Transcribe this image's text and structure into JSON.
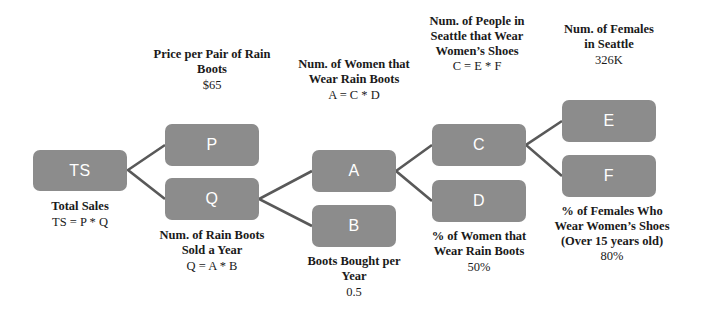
{
  "diagram": {
    "type": "estimation-tree",
    "palette": {
      "node_fill": "#8c8c8c",
      "node_text": "#ffffff",
      "caption_text": "#1a1a1a",
      "connector": "#595959",
      "background": "#ffffff"
    },
    "nodes": [
      {
        "id": "TS",
        "label": "TS"
      },
      {
        "id": "P",
        "label": "P"
      },
      {
        "id": "Q",
        "label": "Q"
      },
      {
        "id": "A",
        "label": "A"
      },
      {
        "id": "B",
        "label": "B"
      },
      {
        "id": "C",
        "label": "C"
      },
      {
        "id": "D",
        "label": "D"
      },
      {
        "id": "E",
        "label": "E"
      },
      {
        "id": "F",
        "label": "F"
      }
    ],
    "captions": {
      "ts": {
        "title": "Total Sales",
        "value": "TS = P * Q"
      },
      "p": {
        "title": "Price per Pair of Rain Boots",
        "value": "$65"
      },
      "q": {
        "title": "Num. of Rain Boots Sold a Year",
        "value": "Q = A * B"
      },
      "a": {
        "title": "Num. of Women that Wear Rain Boots",
        "value": "A = C * D"
      },
      "b": {
        "title": "Boots Bought per Year",
        "value": "0.5"
      },
      "c": {
        "title": "Num. of People in Seattle that Wear Women’s Shoes",
        "value": "C = E * F"
      },
      "d": {
        "title": "% of Women that Wear Rain Boots",
        "value": "50%"
      },
      "e": {
        "title": "Num. of Females in Seattle",
        "value": "326K"
      },
      "f": {
        "title": "% of Females Who Wear Women’s Shoes (Over 15 years old)",
        "value": "80%"
      }
    },
    "edges": [
      {
        "from": "TS",
        "to": "P"
      },
      {
        "from": "TS",
        "to": "Q"
      },
      {
        "from": "Q",
        "to": "A"
      },
      {
        "from": "Q",
        "to": "B"
      },
      {
        "from": "A",
        "to": "C"
      },
      {
        "from": "A",
        "to": "D"
      },
      {
        "from": "C",
        "to": "E"
      },
      {
        "from": "C",
        "to": "F"
      }
    ]
  }
}
